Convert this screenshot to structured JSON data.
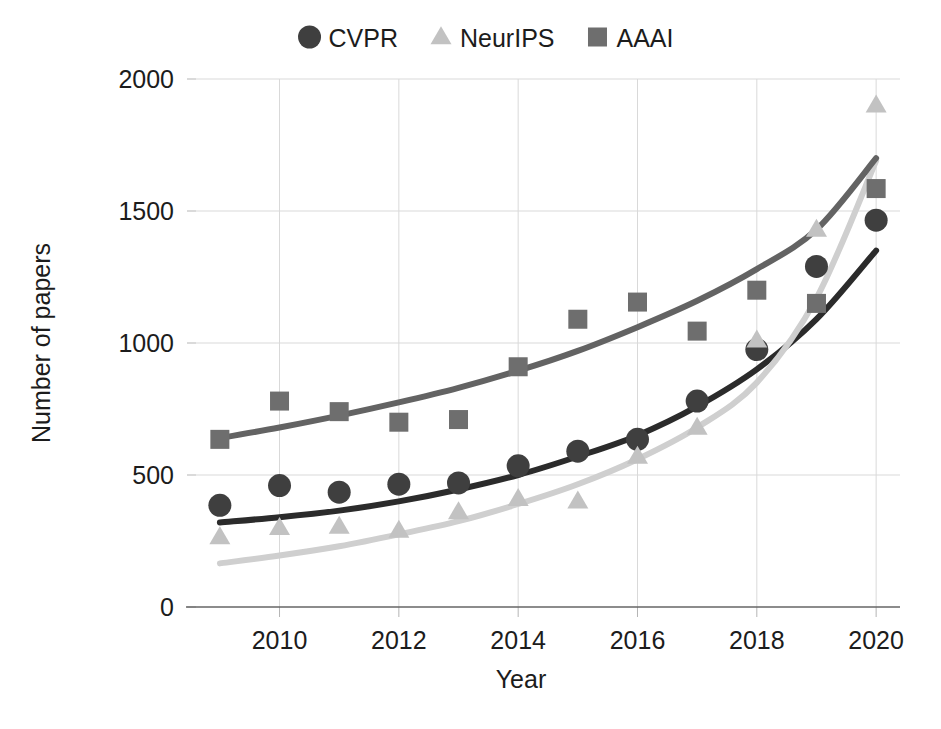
{
  "chart_data": {
    "type": "scatter",
    "title": "",
    "xlabel": "Year",
    "ylabel": "Number of papers",
    "xlim": [
      2008.6,
      2020.4
    ],
    "ylim": [
      0,
      2000
    ],
    "xticks": [
      "2010",
      "2012",
      "2014",
      "2016",
      "2018",
      "2020"
    ],
    "xtick_values": [
      2010,
      2012,
      2014,
      2016,
      2018,
      2020
    ],
    "yticks": [
      "0",
      "500",
      "1000",
      "1500",
      "2000"
    ],
    "ytick_values": [
      0,
      500,
      1000,
      1500,
      2000
    ],
    "grid": true,
    "legend_position": "top-center",
    "x": [
      2009,
      2010,
      2011,
      2012,
      2013,
      2014,
      2015,
      2016,
      2017,
      2018,
      2019,
      2020
    ],
    "series": [
      {
        "name": "CVPR",
        "marker": "circle",
        "color": "#3f3f3f",
        "trend_color": "#2b2b2b",
        "values": [
          385,
          460,
          435,
          465,
          470,
          535,
          590,
          635,
          780,
          975,
          1290,
          1465
        ],
        "trend": [
          320,
          340,
          365,
          400,
          445,
          500,
          570,
          650,
          760,
          900,
          1090,
          1350
        ]
      },
      {
        "name": "NeurIPS",
        "marker": "triangle",
        "color": "#c2c2c2",
        "trend_color": "#cfcfcf",
        "values": [
          265,
          300,
          305,
          290,
          360,
          410,
          400,
          570,
          680,
          1010,
          1430,
          1900
        ],
        "trend": [
          165,
          195,
          230,
          275,
          325,
          390,
          465,
          560,
          680,
          850,
          1170,
          1690
        ]
      },
      {
        "name": "AAAI",
        "marker": "square",
        "color": "#6e6e6e",
        "trend_color": "#636363",
        "values": [
          635,
          780,
          740,
          700,
          710,
          910,
          1090,
          1155,
          1045,
          1200,
          1150,
          1585
        ],
        "trend": [
          640,
          680,
          725,
          775,
          830,
          895,
          970,
          1060,
          1160,
          1280,
          1430,
          1700
        ]
      }
    ]
  },
  "legend": {
    "items": [
      {
        "label": "CVPR",
        "marker": "circle",
        "color": "#3f3f3f"
      },
      {
        "label": "NeurIPS",
        "marker": "triangle",
        "color": "#c2c2c2"
      },
      {
        "label": "AAAI",
        "marker": "square",
        "color": "#6e6e6e"
      }
    ]
  },
  "axes": {
    "x_title": "Year",
    "y_title": "Number of papers"
  }
}
